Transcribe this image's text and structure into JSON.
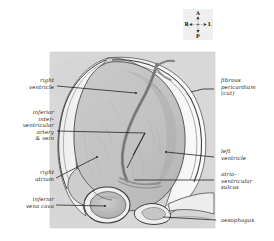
{
  "figure": {
    "panel": {
      "background_color": "#d9d9d9",
      "x": 50,
      "y": 52,
      "width": 165,
      "height": 176
    },
    "colors": {
      "panel_bg": "#d8d8d8",
      "heart_fill": "#c4c4c4",
      "heart_shade": "#b3b3b3",
      "pericardium_fill": "#f2f2f2",
      "vessel": "#8c8c8c",
      "vena_cava_fill": "#bdbdbd",
      "outline": "#3a3a3a",
      "leader_line": "#1a1a1a",
      "label_text": "#1c1c1c"
    }
  },
  "compass": {
    "name": "orientation-compass",
    "background_color": "#efefef",
    "anterior": "A",
    "posterior": "P",
    "right": "R",
    "left": "L"
  },
  "labels": {
    "left": [
      {
        "id": "right-ventricle",
        "text": "right\nventricle"
      },
      {
        "id": "inferior-interventricular-artery-vein",
        "text": "inferior\ninter-\nventricular\nartery\n& vein"
      },
      {
        "id": "right-atrium",
        "text": "right\natrium"
      },
      {
        "id": "inferior-vena-cava",
        "text": "inferior\nvena cava"
      }
    ],
    "right": [
      {
        "id": "fibrous-pericardium-cut",
        "text": "fibrous\npericardium\n(cut)"
      },
      {
        "id": "left-ventricle",
        "text": "left\nventricle"
      },
      {
        "id": "atrioventricular-sulcus",
        "text": "atrio-\nventricular\nsulcus"
      },
      {
        "id": "oesophagus",
        "text": "oesophagus"
      }
    ]
  }
}
